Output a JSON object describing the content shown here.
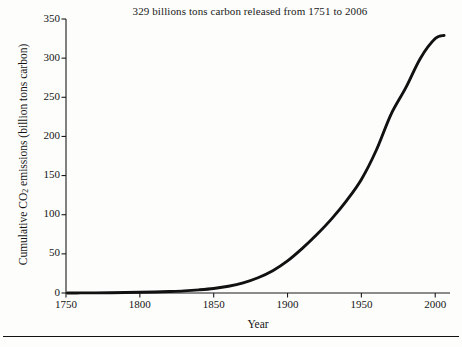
{
  "figure": {
    "title": "329 billions tons carbon released from 1751 to 2006",
    "xlabel": "Year",
    "ylabel_prefix": "Cumulative CO",
    "ylabel_sub": "2",
    "ylabel_suffix": " emissions (billion tons carbon)",
    "line_color": "#111111",
    "axis_color": "#1a1a1a",
    "background_color": "#fdfdfb"
  },
  "chart_data": {
    "type": "line",
    "title": "329 billions tons carbon released from 1751 to 2006",
    "xlabel": "Year",
    "ylabel": "Cumulative CO2 emissions (billion tons carbon)",
    "xlim": [
      1750,
      2010
    ],
    "ylim": [
      0,
      350
    ],
    "xticks": [
      1750,
      1800,
      1850,
      1900,
      1950,
      2000
    ],
    "yticks": [
      0,
      50,
      100,
      150,
      200,
      250,
      300,
      350
    ],
    "grid": false,
    "legend": null,
    "series": [
      {
        "name": "Cumulative CO2 emissions",
        "x": [
          1751,
          1760,
          1770,
          1780,
          1790,
          1800,
          1810,
          1820,
          1830,
          1840,
          1850,
          1860,
          1870,
          1880,
          1890,
          1900,
          1910,
          1920,
          1930,
          1940,
          1950,
          1960,
          1970,
          1980,
          1990,
          2000,
          2006
        ],
        "values": [
          0,
          0.1,
          0.2,
          0.4,
          0.6,
          0.9,
          1.3,
          1.9,
          2.7,
          4.0,
          5.8,
          8.6,
          13.0,
          19.5,
          28.5,
          41.0,
          57.0,
          75.0,
          95.0,
          118.0,
          145.0,
          182.0,
          228.0,
          262.0,
          300.0,
          325.0,
          329.0
        ]
      }
    ]
  },
  "yticks": [
    {
      "value": 350,
      "label": "350"
    },
    {
      "value": 300,
      "label": "300"
    },
    {
      "value": 250,
      "label": "250"
    },
    {
      "value": 200,
      "label": "200"
    },
    {
      "value": 150,
      "label": "150"
    },
    {
      "value": 100,
      "label": "100"
    },
    {
      "value": 50,
      "label": "50"
    },
    {
      "value": 0,
      "label": "0"
    }
  ],
  "xticks": [
    {
      "value": 1750,
      "label": "1750"
    },
    {
      "value": 1800,
      "label": "1800"
    },
    {
      "value": 1850,
      "label": "1850"
    },
    {
      "value": 1900,
      "label": "1900"
    },
    {
      "value": 1950,
      "label": "1950"
    },
    {
      "value": 2000,
      "label": "2000"
    }
  ]
}
